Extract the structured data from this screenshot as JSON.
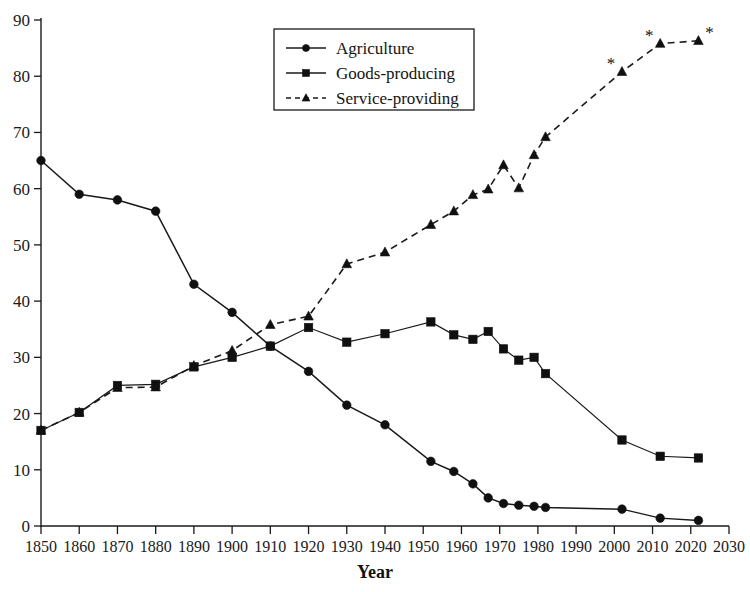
{
  "chart_data": {
    "type": "line",
    "title": "",
    "xlabel": "Year",
    "ylabel": "",
    "xlim": [
      1850,
      2030
    ],
    "ylim": [
      0,
      90
    ],
    "grid": false,
    "legend_position": "top-center",
    "x_ticks": [
      1850,
      1860,
      1870,
      1880,
      1890,
      1900,
      1910,
      1920,
      1930,
      1940,
      1950,
      1960,
      1970,
      1980,
      1990,
      2000,
      2010,
      2020,
      2030
    ],
    "y_ticks": [
      0,
      10,
      20,
      30,
      40,
      50,
      60,
      70,
      80,
      90
    ],
    "annotation_marker": "*",
    "annotation_meaning": "projected",
    "series": [
      {
        "name": "Agriculture",
        "marker": "circle",
        "line_style": "solid",
        "color": "#101010",
        "points": [
          [
            1850,
            65
          ],
          [
            1860,
            59
          ],
          [
            1870,
            58
          ],
          [
            1880,
            56
          ],
          [
            1890,
            43
          ],
          [
            1900,
            38
          ],
          [
            1910,
            32
          ],
          [
            1920,
            27.5
          ],
          [
            1930,
            21.5
          ],
          [
            1940,
            18
          ],
          [
            1952,
            11.5
          ],
          [
            1958,
            9.7
          ],
          [
            1963,
            7.5
          ],
          [
            1967,
            5
          ],
          [
            1971,
            4
          ],
          [
            1975,
            3.7
          ],
          [
            1979,
            3.5
          ],
          [
            1982,
            3.3
          ],
          [
            2002,
            3
          ],
          [
            2012,
            1.4
          ],
          [
            2022,
            1
          ]
        ]
      },
      {
        "name": "Goods-producing",
        "marker": "square",
        "line_style": "solid",
        "color": "#101010",
        "points": [
          [
            1850,
            17
          ],
          [
            1860,
            20.2
          ],
          [
            1870,
            25
          ],
          [
            1880,
            25.2
          ],
          [
            1890,
            28.3
          ],
          [
            1900,
            30
          ],
          [
            1910,
            32
          ],
          [
            1920,
            35.3
          ],
          [
            1930,
            32.7
          ],
          [
            1940,
            34.2
          ],
          [
            1952,
            36.3
          ],
          [
            1958,
            34
          ],
          [
            1963,
            33.2
          ],
          [
            1967,
            34.6
          ],
          [
            1971,
            31.5
          ],
          [
            1975,
            29.5
          ],
          [
            1979,
            30
          ],
          [
            1982,
            27.1
          ],
          [
            2002,
            15.3
          ],
          [
            2012,
            12.4
          ],
          [
            2022,
            12.1
          ]
        ]
      },
      {
        "name": "Service-providing",
        "marker": "triangle",
        "line_style": "dashed",
        "color": "#101010",
        "points": [
          [
            1850,
            17
          ],
          [
            1860,
            20.2
          ],
          [
            1870,
            24.6
          ],
          [
            1880,
            24.7
          ],
          [
            1890,
            28.5
          ],
          [
            1900,
            31.2
          ],
          [
            1910,
            35.8
          ],
          [
            1920,
            37.3
          ],
          [
            1930,
            46.6
          ],
          [
            1940,
            48.7
          ],
          [
            1952,
            53.6
          ],
          [
            1958,
            56
          ],
          [
            1963,
            58.9
          ],
          [
            1967,
            59.9
          ],
          [
            1971,
            64.2
          ],
          [
            1975,
            60.1
          ],
          [
            1979,
            66
          ],
          [
            1982,
            69.2
          ],
          [
            2002,
            80.8
          ],
          [
            2012,
            85.8
          ],
          [
            2022,
            86.3
          ]
        ],
        "projected_points": [
          [
            2002,
            80.8
          ],
          [
            2012,
            85.8
          ],
          [
            2022,
            86.3
          ]
        ]
      }
    ]
  },
  "legend": {
    "entries": [
      {
        "label": "Agriculture",
        "marker": "circle",
        "line_style": "solid"
      },
      {
        "label": "Goods-producing",
        "marker": "square",
        "line_style": "solid"
      },
      {
        "label": "Service-providing",
        "marker": "triangle",
        "line_style": "dashed"
      }
    ]
  },
  "axes": {
    "x_title": "Year",
    "y_title": ""
  }
}
